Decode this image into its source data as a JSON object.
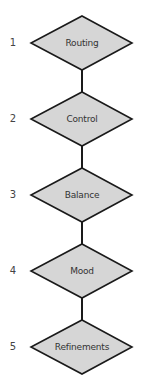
{
  "diagram": {
    "type": "vertical-flowchart",
    "node_shape": "diamond",
    "colors": {
      "node_fill": "#d6d6d6",
      "node_stroke": "#1a1a1a",
      "connector": "#1a1a1a",
      "number_text": "#444444",
      "label_text": "#333333",
      "background": "#ffffff"
    },
    "steps": [
      {
        "number": "1",
        "label": "Routing"
      },
      {
        "number": "2",
        "label": "Control"
      },
      {
        "number": "3",
        "label": "Balance"
      },
      {
        "number": "4",
        "label": "Mood"
      },
      {
        "number": "5",
        "label": "Refinements"
      }
    ]
  }
}
